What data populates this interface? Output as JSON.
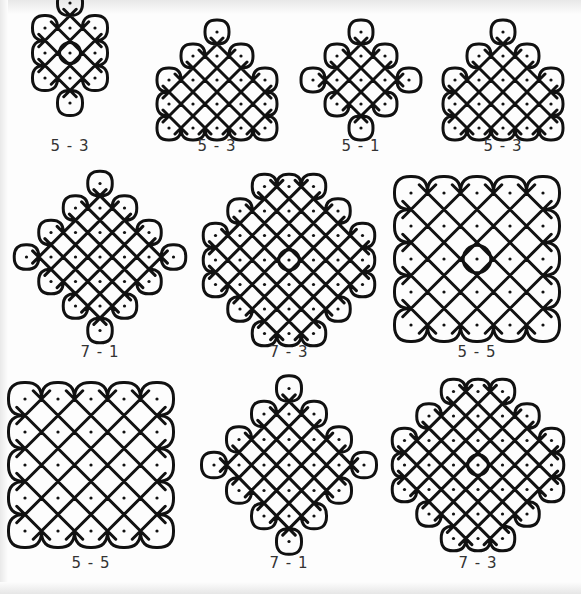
{
  "sheet": {
    "title": "Kolam dot patterns",
    "stroke_color": "#111111",
    "background": "#fdfdfd"
  },
  "figures": [
    {
      "id": "f1",
      "label": "5 - 3",
      "label_x": 70,
      "label_y": 146,
      "cx": 70,
      "cy": 78,
      "dots": [
        [
          0,
          -3
        ],
        [
          -1,
          -2
        ],
        [
          0,
          -2
        ],
        [
          1,
          -2
        ],
        [
          -1,
          -1
        ],
        [
          0,
          -1
        ],
        [
          1,
          -1
        ],
        [
          -1,
          0
        ],
        [
          0,
          0
        ],
        [
          1,
          0
        ],
        [
          0,
          1
        ]
      ],
      "spacing": 25,
      "ring": [
        [
          0,
          -1
        ]
      ]
    },
    {
      "id": "f2",
      "label": "5 - 3",
      "label_x": 217,
      "label_y": 146,
      "cx": 217,
      "cy": 80,
      "dots": [
        [
          0,
          -2
        ],
        [
          -1,
          -1
        ],
        [
          0,
          -1
        ],
        [
          1,
          -1
        ],
        [
          -2,
          0
        ],
        [
          -1,
          0
        ],
        [
          0,
          0
        ],
        [
          1,
          0
        ],
        [
          2,
          0
        ],
        [
          -2,
          1
        ],
        [
          -1,
          1
        ],
        [
          0,
          1
        ],
        [
          1,
          1
        ],
        [
          2,
          1
        ],
        [
          -2,
          2
        ],
        [
          -1,
          2
        ],
        [
          0,
          2
        ],
        [
          1,
          2
        ],
        [
          2,
          2
        ]
      ],
      "spacing": 24,
      "ring": []
    },
    {
      "id": "f3",
      "label": "5 - 1",
      "label_x": 361,
      "label_y": 146,
      "cx": 361,
      "cy": 80,
      "dots": [
        [
          0,
          -2
        ],
        [
          -1,
          -1
        ],
        [
          0,
          -1
        ],
        [
          1,
          -1
        ],
        [
          -2,
          0
        ],
        [
          -1,
          0
        ],
        [
          0,
          0
        ],
        [
          1,
          0
        ],
        [
          2,
          0
        ],
        [
          -1,
          1
        ],
        [
          0,
          1
        ],
        [
          1,
          1
        ],
        [
          0,
          2
        ]
      ],
      "spacing": 24,
      "ring": []
    },
    {
      "id": "f4",
      "label": "5 - 3",
      "label_x": 503,
      "label_y": 146,
      "cx": 503,
      "cy": 80,
      "dots": [
        [
          0,
          -2
        ],
        [
          -1,
          -1
        ],
        [
          0,
          -1
        ],
        [
          1,
          -1
        ],
        [
          -2,
          0
        ],
        [
          -1,
          0
        ],
        [
          0,
          0
        ],
        [
          1,
          0
        ],
        [
          2,
          0
        ],
        [
          -2,
          1
        ],
        [
          -1,
          1
        ],
        [
          0,
          1
        ],
        [
          1,
          1
        ],
        [
          2,
          1
        ],
        [
          -2,
          2
        ],
        [
          -1,
          2
        ],
        [
          0,
          2
        ],
        [
          1,
          2
        ],
        [
          2,
          2
        ]
      ],
      "spacing": 24,
      "ring": []
    },
    {
      "id": "f5",
      "label": "7 - 1",
      "label_x": 100,
      "label_y": 352,
      "cx": 100,
      "cy": 257,
      "dots": [
        [
          0,
          -3
        ],
        [
          -1,
          -2
        ],
        [
          0,
          -2
        ],
        [
          1,
          -2
        ],
        [
          -2,
          -1
        ],
        [
          -1,
          -1
        ],
        [
          0,
          -1
        ],
        [
          1,
          -1
        ],
        [
          2,
          -1
        ],
        [
          -3,
          0
        ],
        [
          -2,
          0
        ],
        [
          -1,
          0
        ],
        [
          0,
          0
        ],
        [
          1,
          0
        ],
        [
          2,
          0
        ],
        [
          3,
          0
        ],
        [
          -2,
          1
        ],
        [
          -1,
          1
        ],
        [
          0,
          1
        ],
        [
          1,
          1
        ],
        [
          2,
          1
        ],
        [
          -1,
          2
        ],
        [
          0,
          2
        ],
        [
          1,
          2
        ],
        [
          0,
          3
        ]
      ],
      "spacing": 24.5,
      "ring": []
    },
    {
      "id": "f6",
      "label": "7 - 3",
      "label_x": 289,
      "label_y": 352,
      "cx": 289,
      "cy": 260,
      "dots": [
        [
          -1,
          -3
        ],
        [
          0,
          -3
        ],
        [
          1,
          -3
        ],
        [
          -2,
          -2
        ],
        [
          -1,
          -2
        ],
        [
          0,
          -2
        ],
        [
          1,
          -2
        ],
        [
          2,
          -2
        ],
        [
          -3,
          -1
        ],
        [
          -2,
          -1
        ],
        [
          -1,
          -1
        ],
        [
          0,
          -1
        ],
        [
          1,
          -1
        ],
        [
          2,
          -1
        ],
        [
          3,
          -1
        ],
        [
          -3,
          0
        ],
        [
          -2,
          0
        ],
        [
          -1,
          0
        ],
        [
          0,
          0
        ],
        [
          1,
          0
        ],
        [
          2,
          0
        ],
        [
          3,
          0
        ],
        [
          -3,
          1
        ],
        [
          -2,
          1
        ],
        [
          -1,
          1
        ],
        [
          0,
          1
        ],
        [
          1,
          1
        ],
        [
          2,
          1
        ],
        [
          3,
          1
        ],
        [
          -2,
          2
        ],
        [
          -1,
          2
        ],
        [
          0,
          2
        ],
        [
          1,
          2
        ],
        [
          2,
          2
        ],
        [
          -1,
          3
        ],
        [
          0,
          3
        ],
        [
          1,
          3
        ]
      ],
      "spacing": 24.5,
      "ring": [
        [
          0,
          0
        ]
      ]
    },
    {
      "id": "f7",
      "label": "5 - 5",
      "label_x": 477,
      "label_y": 352,
      "cx": 477,
      "cy": 259,
      "dots": [
        [
          -2,
          -2
        ],
        [
          -1,
          -2
        ],
        [
          0,
          -2
        ],
        [
          1,
          -2
        ],
        [
          2,
          -2
        ],
        [
          -2,
          -1
        ],
        [
          -1,
          -1
        ],
        [
          0,
          -1
        ],
        [
          1,
          -1
        ],
        [
          2,
          -1
        ],
        [
          -2,
          0
        ],
        [
          -1,
          0
        ],
        [
          0,
          0
        ],
        [
          1,
          0
        ],
        [
          2,
          0
        ],
        [
          -2,
          1
        ],
        [
          -1,
          1
        ],
        [
          0,
          1
        ],
        [
          1,
          1
        ],
        [
          2,
          1
        ],
        [
          -2,
          2
        ],
        [
          -1,
          2
        ],
        [
          0,
          2
        ],
        [
          1,
          2
        ],
        [
          2,
          2
        ]
      ],
      "spacing": 33,
      "ring": [
        [
          0,
          0
        ]
      ]
    },
    {
      "id": "f8",
      "label": "5 - 5",
      "label_x": 91,
      "label_y": 563,
      "cx": 91,
      "cy": 465,
      "dots": [
        [
          -2,
          -2
        ],
        [
          -1,
          -2
        ],
        [
          0,
          -2
        ],
        [
          1,
          -2
        ],
        [
          2,
          -2
        ],
        [
          -2,
          -1
        ],
        [
          -1,
          -1
        ],
        [
          0,
          -1
        ],
        [
          1,
          -1
        ],
        [
          2,
          -1
        ],
        [
          -2,
          0
        ],
        [
          -1,
          0
        ],
        [
          0,
          0
        ],
        [
          1,
          0
        ],
        [
          2,
          0
        ],
        [
          -2,
          1
        ],
        [
          -1,
          1
        ],
        [
          0,
          1
        ],
        [
          1,
          1
        ],
        [
          2,
          1
        ],
        [
          -2,
          2
        ],
        [
          -1,
          2
        ],
        [
          0,
          2
        ],
        [
          1,
          2
        ],
        [
          2,
          2
        ]
      ],
      "spacing": 33,
      "ring": []
    },
    {
      "id": "f9",
      "label": "7 - 1",
      "label_x": 289,
      "label_y": 563,
      "cx": 289,
      "cy": 465,
      "dots": [
        [
          0,
          -3
        ],
        [
          -1,
          -2
        ],
        [
          0,
          -2
        ],
        [
          1,
          -2
        ],
        [
          -2,
          -1
        ],
        [
          -1,
          -1
        ],
        [
          0,
          -1
        ],
        [
          1,
          -1
        ],
        [
          2,
          -1
        ],
        [
          -3,
          0
        ],
        [
          -2,
          0
        ],
        [
          -1,
          0
        ],
        [
          0,
          0
        ],
        [
          1,
          0
        ],
        [
          2,
          0
        ],
        [
          3,
          0
        ],
        [
          -2,
          1
        ],
        [
          -1,
          1
        ],
        [
          0,
          1
        ],
        [
          1,
          1
        ],
        [
          2,
          1
        ],
        [
          -1,
          2
        ],
        [
          0,
          2
        ],
        [
          1,
          2
        ],
        [
          0,
          3
        ]
      ],
      "spacing": 25,
      "yspacing": 25.5,
      "ring": []
    },
    {
      "id": "f10",
      "label": "7 - 3",
      "label_x": 478,
      "label_y": 563,
      "cx": 478,
      "cy": 465,
      "dots": [
        [
          -1,
          -3
        ],
        [
          0,
          -3
        ],
        [
          1,
          -3
        ],
        [
          -2,
          -2
        ],
        [
          -1,
          -2
        ],
        [
          0,
          -2
        ],
        [
          1,
          -2
        ],
        [
          2,
          -2
        ],
        [
          -3,
          -1
        ],
        [
          -2,
          -1
        ],
        [
          -1,
          -1
        ],
        [
          0,
          -1
        ],
        [
          1,
          -1
        ],
        [
          2,
          -1
        ],
        [
          3,
          -1
        ],
        [
          -3,
          0
        ],
        [
          -2,
          0
        ],
        [
          -1,
          0
        ],
        [
          0,
          0
        ],
        [
          1,
          0
        ],
        [
          2,
          0
        ],
        [
          3,
          0
        ],
        [
          -3,
          1
        ],
        [
          -2,
          1
        ],
        [
          -1,
          1
        ],
        [
          0,
          1
        ],
        [
          1,
          1
        ],
        [
          2,
          1
        ],
        [
          3,
          1
        ],
        [
          -2,
          2
        ],
        [
          -1,
          2
        ],
        [
          0,
          2
        ],
        [
          1,
          2
        ],
        [
          2,
          2
        ],
        [
          -1,
          3
        ],
        [
          0,
          3
        ],
        [
          1,
          3
        ]
      ],
      "spacing": 24.5,
      "ring": [
        [
          0,
          0
        ]
      ]
    }
  ]
}
